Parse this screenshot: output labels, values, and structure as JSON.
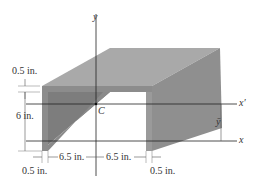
{
  "figure": {
    "type": "channel-section-3d",
    "colors": {
      "top_face": "#a9a9a9",
      "front_face": "#8c8c8c",
      "inner_wall": "#7d7d7d",
      "right_side": "#8f8f8f",
      "inner_shadow": "#9a9a9a",
      "line": "#222222",
      "dim_line": "#555555",
      "background": "#ffffff"
    }
  },
  "axes": {
    "y_label": "y",
    "x_label": "x",
    "x_prime_label": "x′",
    "ybar_label": "ȳ",
    "centroid_label": "C"
  },
  "dimensions": {
    "top_flange_thickness": "0.5 in.",
    "height": "6 in.",
    "left_half_width": "6.5 in.",
    "right_half_width": "6.5 in.",
    "left_web_thickness": "0.5 in.",
    "right_web_thickness": "0.5 in."
  }
}
